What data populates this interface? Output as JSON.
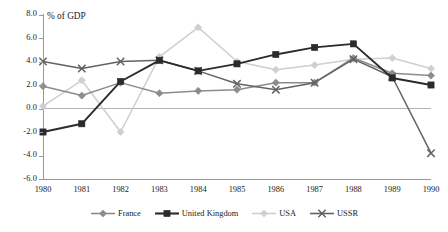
{
  "chart_data": {
    "type": "line",
    "title": "% of GDP",
    "xlabel": "",
    "ylabel": "% of GDP",
    "categories": [
      "1980",
      "1981",
      "1982",
      "1983",
      "1984",
      "1985",
      "1986",
      "1987",
      "1988",
      "1989",
      "1990"
    ],
    "x": [
      1980,
      1981,
      1982,
      1983,
      1984,
      1985,
      1986,
      1987,
      1988,
      1989,
      1990
    ],
    "ylim": [
      -6.0,
      8.0
    ],
    "ytick_step": 2.0,
    "yticks": [
      "8.0",
      "6.0",
      "4.0",
      "2.0",
      "0.0",
      "-2.0",
      "-4.0",
      "-6.0"
    ],
    "ytick_values": [
      8.0,
      6.0,
      4.0,
      2.0,
      0.0,
      -2.0,
      -4.0,
      -6.0
    ],
    "grid": false,
    "zero_line": true,
    "legend_position": "bottom",
    "series": [
      {
        "name": "France",
        "color": "#8c8c8c",
        "marker": "diamond",
        "values": [
          1.9,
          1.1,
          2.2,
          1.3,
          1.5,
          1.6,
          2.2,
          2.2,
          4.3,
          3.0,
          2.8
        ]
      },
      {
        "name": "United Kingdom",
        "color": "#2b2b2b",
        "marker": "square",
        "values": [
          -2.0,
          -1.3,
          2.3,
          4.1,
          3.2,
          3.8,
          4.6,
          5.2,
          5.5,
          2.6,
          2.0
        ]
      },
      {
        "name": "USA",
        "color": "#cfcfcf",
        "marker": "diamond",
        "values": [
          0.2,
          2.4,
          -2.0,
          4.4,
          6.9,
          4.0,
          3.3,
          3.7,
          4.2,
          4.3,
          3.4
        ]
      },
      {
        "name": "USSR",
        "color": "#636363",
        "marker": "cross",
        "values": [
          4.0,
          3.4,
          4.0,
          4.1,
          3.2,
          2.1,
          1.6,
          2.2,
          4.2,
          2.7,
          -3.8
        ]
      }
    ]
  },
  "legend": {
    "items": [
      {
        "label": "France",
        "color": "#8c8c8c",
        "marker": "diamond"
      },
      {
        "label": "United Kingdom",
        "color": "#2b2b2b",
        "marker": "square"
      },
      {
        "label": "USA",
        "color": "#cfcfcf",
        "marker": "diamond"
      },
      {
        "label": "USSR",
        "color": "#636363",
        "marker": "cross"
      }
    ]
  }
}
